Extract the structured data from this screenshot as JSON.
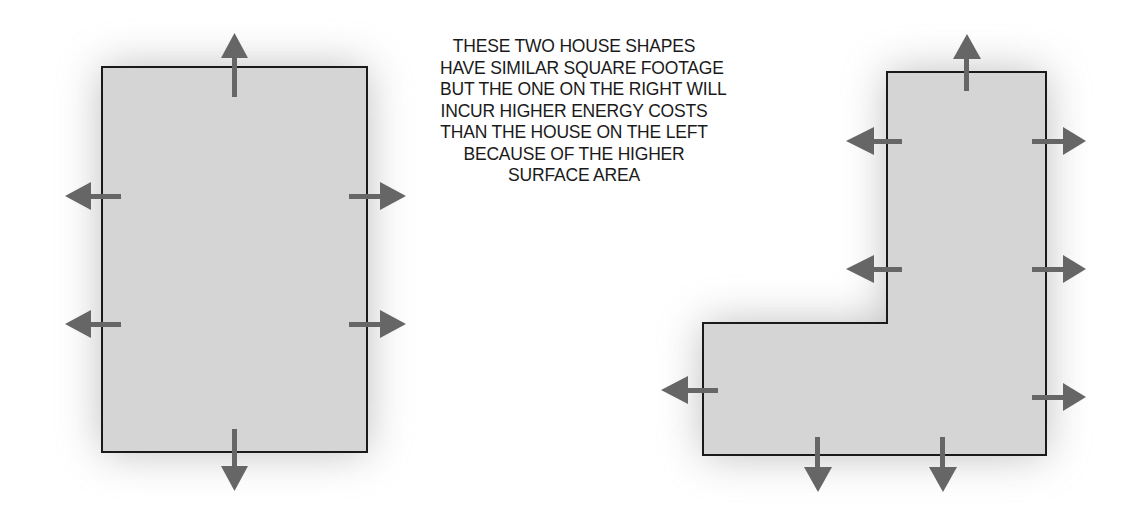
{
  "caption": {
    "lines": [
      "THESE TWO HOUSE SHAPES",
      "HAVE SIMILAR SQUARE FOOTAGE",
      "BUT THE ONE ON THE RIGHT WILL",
      "INCUR HIGHER ENERGY COSTS",
      "THAN THE HOUSE ON THE LEFT",
      "BECAUSE OF THE HIGHER",
      "SURFACE AREA"
    ]
  },
  "shapes": {
    "left": {
      "type": "rectangle",
      "label": "compact-house",
      "heat_loss_arrows": 6
    },
    "right": {
      "type": "L-shape",
      "label": "L-shaped-house",
      "heat_loss_arrows": 9
    }
  },
  "colors": {
    "fill": "#d5d5d5",
    "outline": "#1a1a1a",
    "arrow": "#666666",
    "shadow": "#9a9a9a"
  }
}
